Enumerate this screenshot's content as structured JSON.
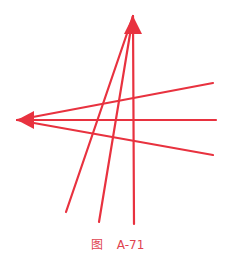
{
  "diagram": {
    "color": "#e8323f",
    "stroke_width": 2.2,
    "arrow_tips": [
      {
        "name": "upper-arrowhead",
        "x": 133,
        "y": 16,
        "direction": "up"
      },
      {
        "name": "left-arrowhead",
        "x": 17,
        "y": 120,
        "direction": "left"
      }
    ],
    "converge_up_lines": [
      {
        "x1": 66,
        "y1": 212,
        "x2": 133,
        "y2": 16
      },
      {
        "x1": 99,
        "y1": 222,
        "x2": 133,
        "y2": 16
      },
      {
        "x1": 134,
        "y1": 224,
        "x2": 133,
        "y2": 16
      }
    ],
    "converge_left_lines": [
      {
        "x1": 213,
        "y1": 83,
        "x2": 17,
        "y2": 120
      },
      {
        "x1": 216,
        "y1": 120,
        "x2": 17,
        "y2": 120
      },
      {
        "x1": 213,
        "y1": 155,
        "x2": 17,
        "y2": 120
      }
    ]
  },
  "caption": {
    "prefix": "图",
    "label": "A-71"
  }
}
